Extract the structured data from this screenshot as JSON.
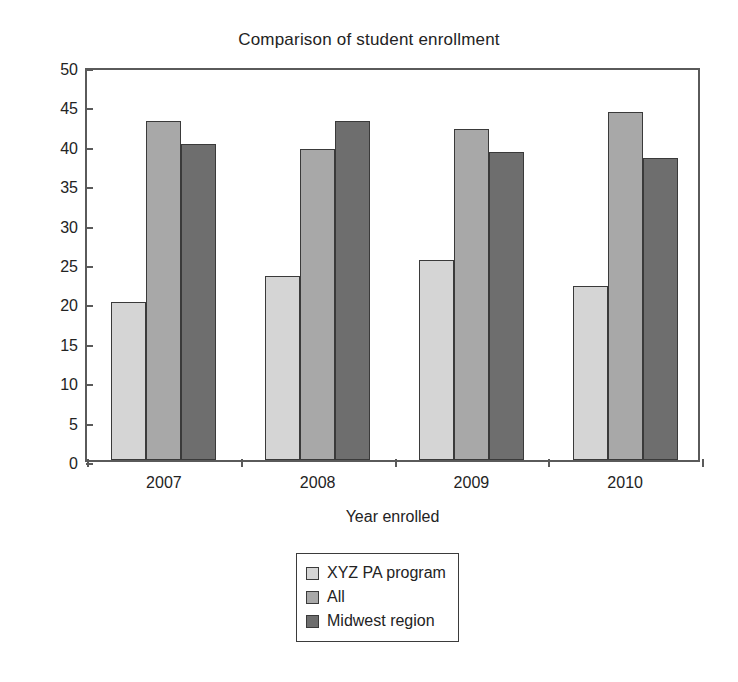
{
  "chart_data": {
    "type": "bar",
    "title": "Comparison of student enrollment",
    "xlabel": "Year enrolled",
    "ylabel": "",
    "categories": [
      "2007",
      "2008",
      "2009",
      "2010"
    ],
    "series": [
      {
        "name": "XYZ PA program",
        "color": "#d5d5d5",
        "values": [
          20.0,
          23.3,
          25.4,
          22.1
        ]
      },
      {
        "name": "All",
        "color": "#a8a8a8",
        "values": [
          43.0,
          39.5,
          42.0,
          44.2
        ]
      },
      {
        "name": "Midwest region",
        "color": "#6e6e6e",
        "values": [
          40.1,
          43.0,
          39.1,
          38.3
        ]
      }
    ],
    "ylim": [
      0,
      50
    ],
    "yticks": [
      "0",
      "5",
      "10",
      "15",
      "20",
      "25",
      "30",
      "35",
      "40",
      "45",
      "50"
    ],
    "ytick_values": [
      0,
      5,
      10,
      15,
      20,
      25,
      30,
      35,
      40,
      45,
      50
    ],
    "grid": false,
    "legend_position": "bottom-center",
    "legend_entries": [
      "XYZ PA program",
      "All",
      "Midwest region"
    ]
  }
}
